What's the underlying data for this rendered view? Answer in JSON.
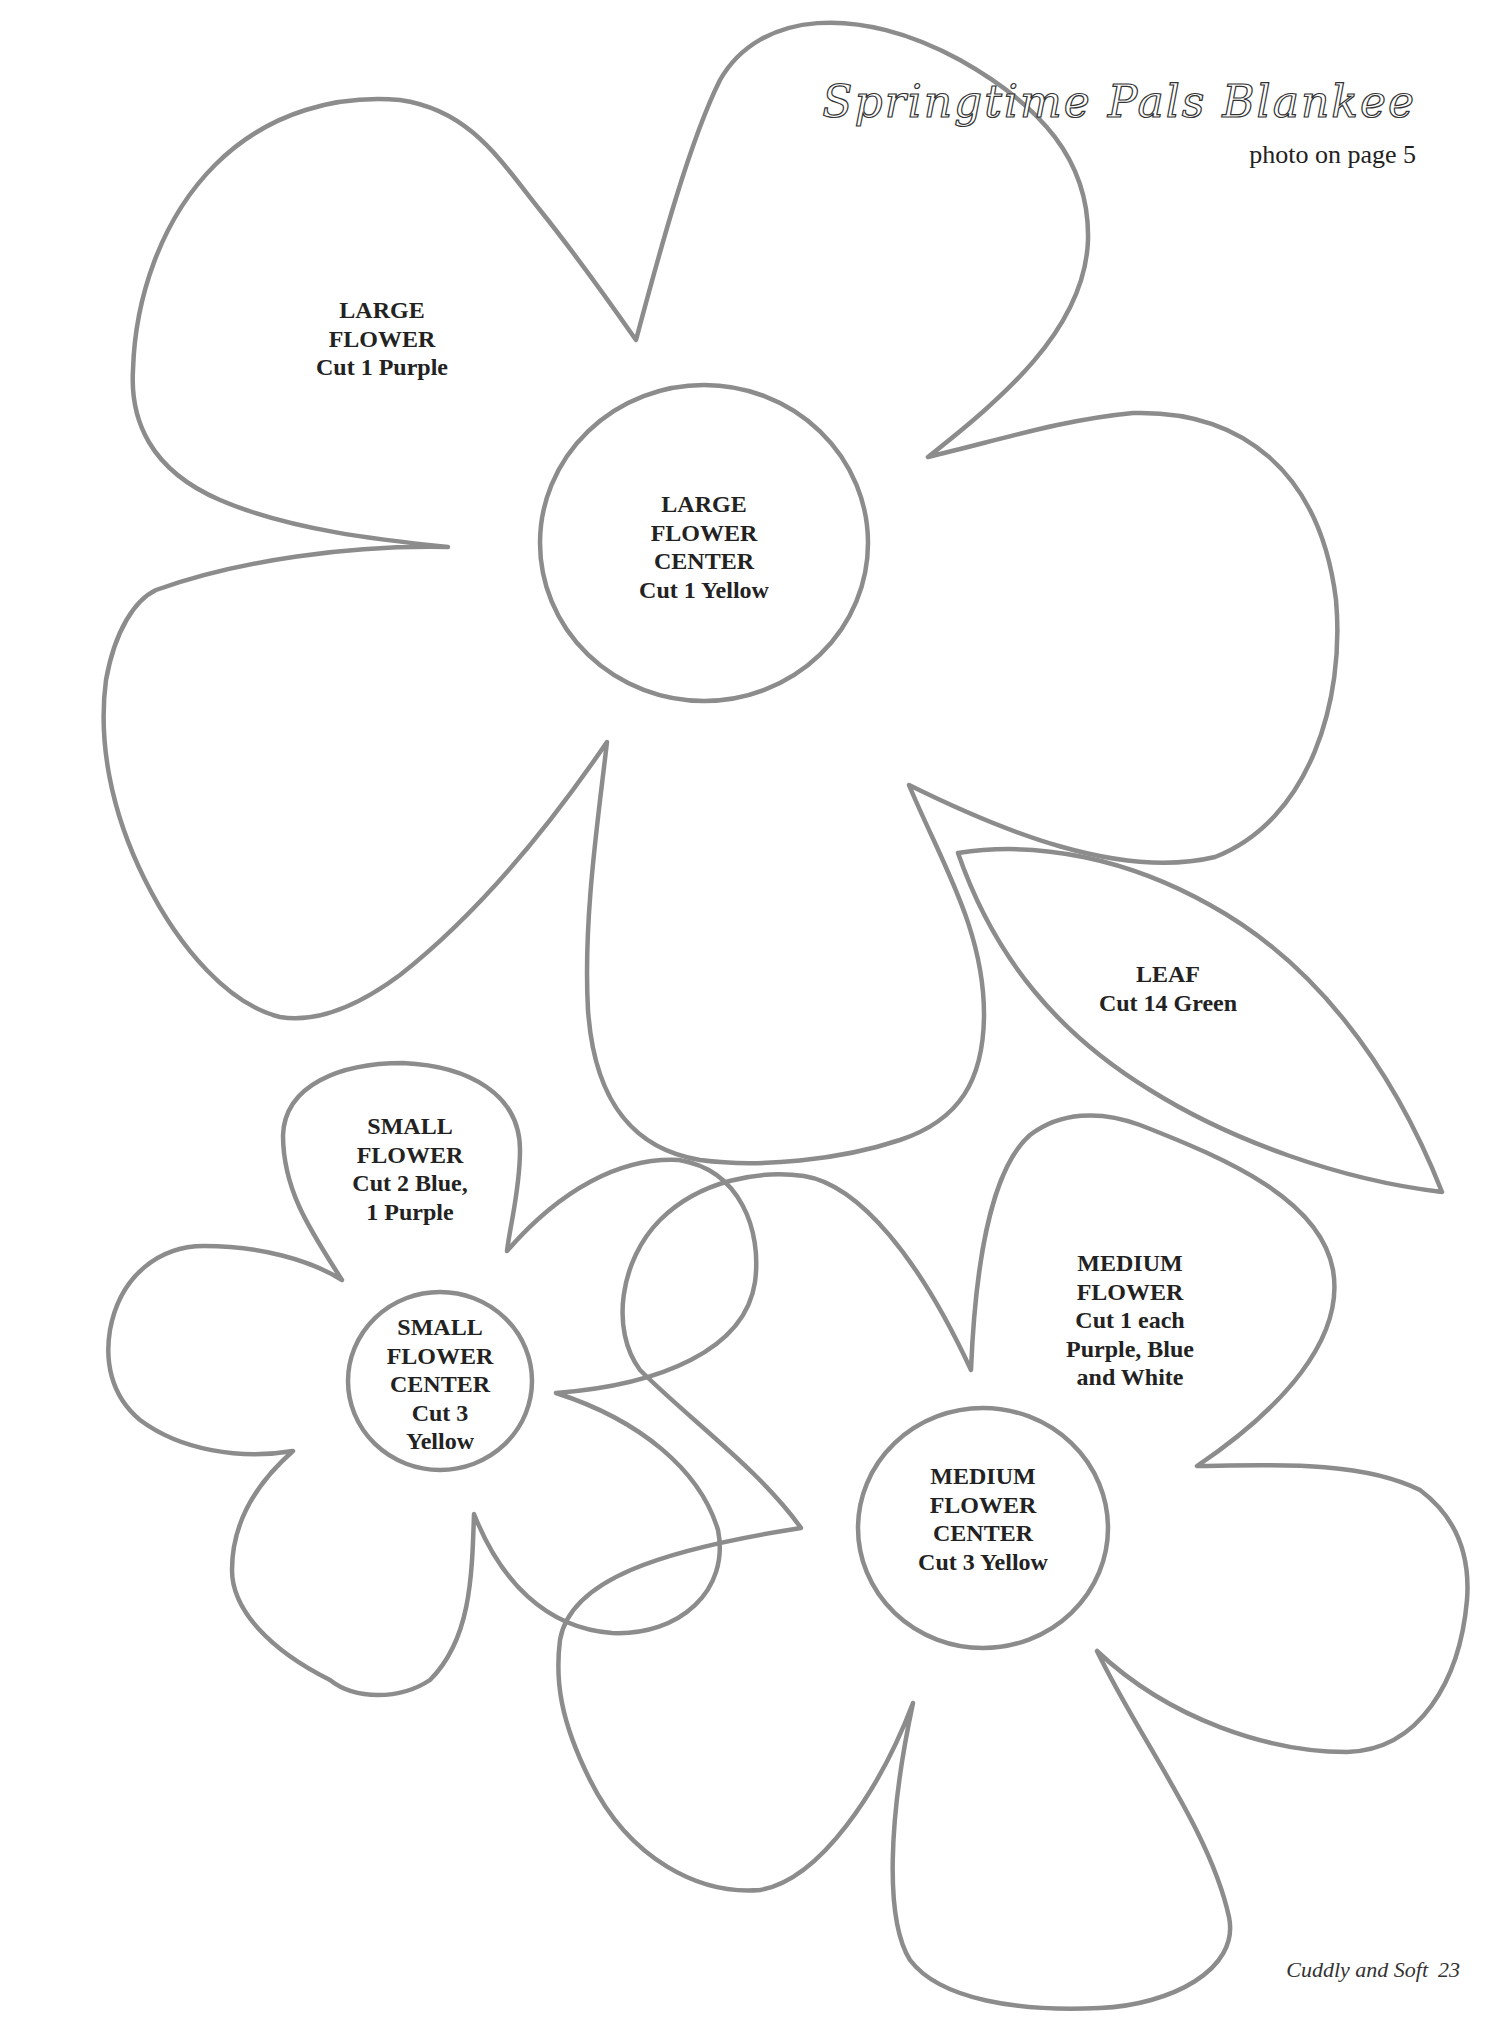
{
  "header": {
    "title": "Springtime Pals Blankee",
    "subtitle": "photo on page 5"
  },
  "footer": {
    "book_title": "Cuddly and Soft",
    "page_number": "23"
  },
  "colors": {
    "outline": "#8c8c8c",
    "text": "#222222",
    "background": "#ffffff"
  },
  "patterns": {
    "large_flower": {
      "lines": [
        "LARGE",
        "FLOWER",
        "Cut 1 Purple"
      ]
    },
    "large_flower_center": {
      "lines": [
        "LARGE",
        "FLOWER",
        "CENTER",
        "Cut 1 Yellow"
      ]
    },
    "leaf": {
      "lines": [
        "LEAF",
        "Cut 14 Green"
      ]
    },
    "small_flower": {
      "lines": [
        "SMALL",
        "FLOWER",
        "Cut 2 Blue,",
        "1 Purple"
      ]
    },
    "small_flower_center": {
      "lines": [
        "SMALL",
        "FLOWER",
        "CENTER",
        "Cut 3",
        "Yellow"
      ]
    },
    "medium_flower": {
      "lines": [
        "MEDIUM",
        "FLOWER",
        "Cut 1 each",
        "Purple, Blue",
        "and White"
      ]
    },
    "medium_flower_center": {
      "lines": [
        "MEDIUM",
        "FLOWER",
        "CENTER",
        "Cut 3 Yellow"
      ]
    }
  }
}
